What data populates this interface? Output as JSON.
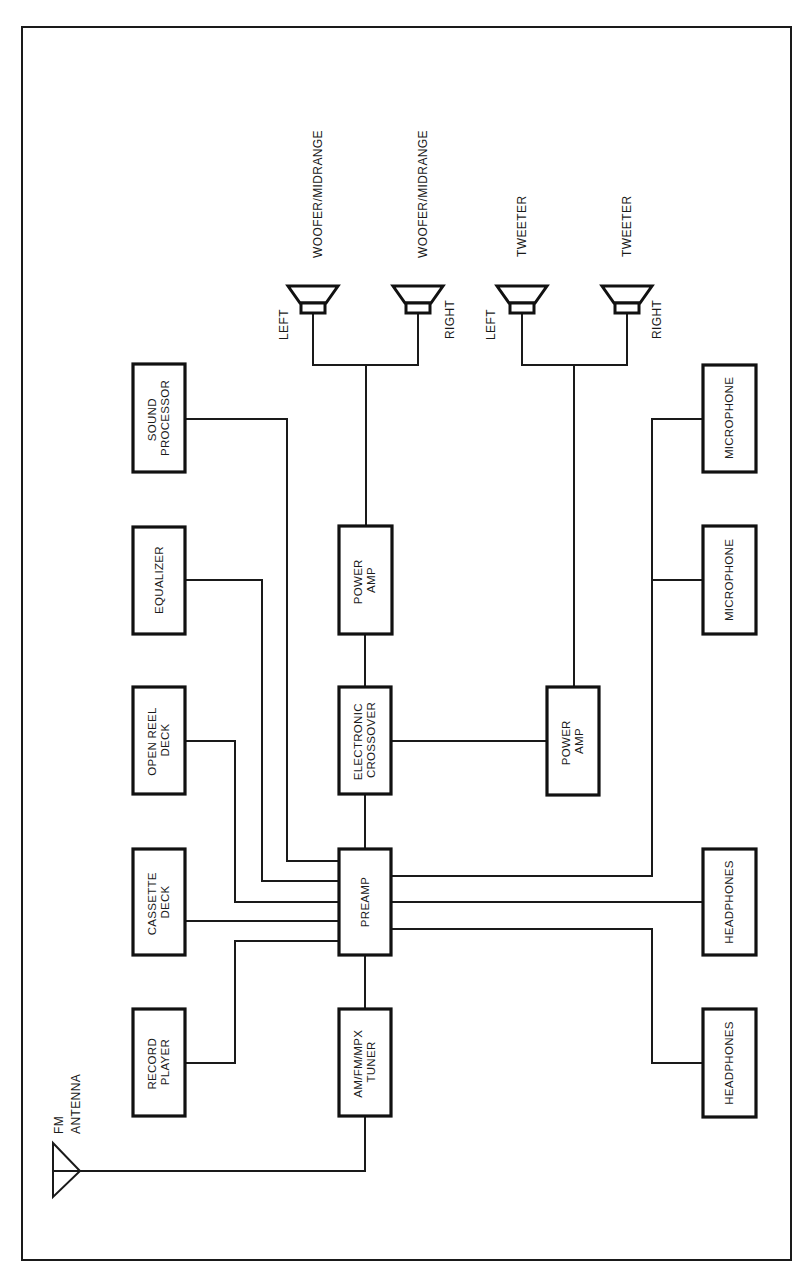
{
  "diagram": {
    "components": {
      "sound_processor": [
        "SOUND",
        "PROCESSOR"
      ],
      "equalizer": [
        "EQUALIZER"
      ],
      "open_reel_deck": [
        "OPEN REEL",
        "DECK"
      ],
      "cassette_deck": [
        "CASSETTE",
        "DECK"
      ],
      "record_player": [
        "RECORD",
        "PLAYER"
      ],
      "power_amp_woofer": [
        "POWER",
        "AMP"
      ],
      "electronic_crossover": [
        "ELECTRONIC",
        "CROSSOVER"
      ],
      "preamp": [
        "PREAMP"
      ],
      "tuner": [
        "AM/FM/MPX",
        "TUNER"
      ],
      "power_amp_tweeter": [
        "POWER",
        "AMP"
      ],
      "microphone_1": [
        "MICROPHONE"
      ],
      "microphone_2": [
        "MICROPHONE"
      ],
      "headphones_1": [
        "HEADPHONES"
      ],
      "headphones_2": [
        "HEADPHONES"
      ]
    },
    "speakers": [
      {
        "type": "WOOFER/MIDRANGE",
        "side": "LEFT"
      },
      {
        "type": "WOOFER/MIDRANGE",
        "side": "RIGHT"
      },
      {
        "type": "TWEETER",
        "side": "LEFT"
      },
      {
        "type": "TWEETER",
        "side": "RIGHT"
      }
    ],
    "antenna": {
      "line1": "FM",
      "line2": "ANTENNA"
    },
    "connections": [
      [
        "sound_processor",
        "preamp"
      ],
      [
        "equalizer",
        "preamp"
      ],
      [
        "open_reel_deck",
        "preamp"
      ],
      [
        "cassette_deck",
        "preamp"
      ],
      [
        "record_player",
        "preamp"
      ],
      [
        "tuner",
        "preamp"
      ],
      [
        "antenna",
        "tuner"
      ],
      [
        "preamp",
        "electronic_crossover"
      ],
      [
        "electronic_crossover",
        "power_amp_woofer"
      ],
      [
        "electronic_crossover",
        "power_amp_tweeter"
      ],
      [
        "power_amp_woofer",
        "woofer_left"
      ],
      [
        "power_amp_woofer",
        "woofer_right"
      ],
      [
        "power_amp_tweeter",
        "tweeter_left"
      ],
      [
        "power_amp_tweeter",
        "tweeter_right"
      ],
      [
        "microphone_1",
        "preamp"
      ],
      [
        "microphone_2",
        "preamp"
      ],
      [
        "preamp",
        "headphones_1"
      ],
      [
        "preamp",
        "headphones_2"
      ]
    ]
  }
}
